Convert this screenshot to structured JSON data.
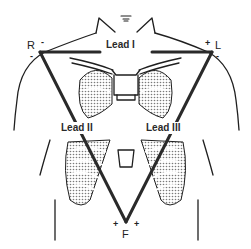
{
  "diagram": {
    "type": "einthoven-triangle",
    "colors": {
      "line": "#2a2a2a",
      "stroke": "#1f1f1f",
      "shade": "#9a9a9a",
      "background": "#ffffff"
    },
    "electrodes": {
      "right_arm": {
        "label": "R",
        "top_sign": "-",
        "bottom_sign": "-"
      },
      "left_arm": {
        "label": "L",
        "top_sign": "+",
        "bottom_sign": "-"
      },
      "foot": {
        "label": "F",
        "left_sign": "+",
        "right_sign": "+"
      }
    },
    "leads": [
      {
        "label": "Lead I",
        "from": "R",
        "to": "L"
      },
      {
        "label": "Lead II",
        "from": "R",
        "to": "F"
      },
      {
        "label": "Lead III",
        "from": "L",
        "to": "F"
      }
    ]
  }
}
